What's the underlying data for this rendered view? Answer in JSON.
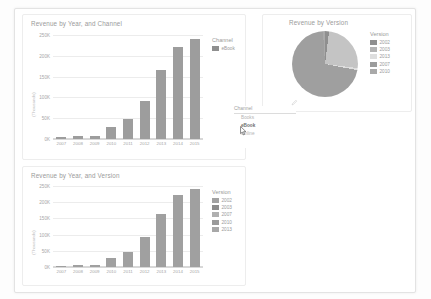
{
  "report": {
    "background_color": "#ffffff",
    "accent_color": "#9d9d9d"
  },
  "charts": {
    "top_left": {
      "title": "Revenue by Year, and Channel",
      "legend_title": "Channel",
      "legend_items": [
        {
          "label": "eBook",
          "color": "#8f8f8f"
        }
      ]
    },
    "bottom_left": {
      "title": "Revenue by Year, and Version",
      "legend_title": "Version",
      "legend_items": [
        {
          "label": "2002",
          "color": "#a2a2a2"
        },
        {
          "label": "2003",
          "color": "#8d8d8d"
        },
        {
          "label": "2007",
          "color": "#b0b0b0"
        },
        {
          "label": "2010",
          "color": "#9a9a9a"
        },
        {
          "label": "2013",
          "color": "#a8a8a8"
        }
      ]
    },
    "pie": {
      "title": "Revenue by Version",
      "legend_title": "Version",
      "legend_items": [
        {
          "label": "2002",
          "color": "#8f8f8f"
        },
        {
          "label": "2003",
          "color": "#b4b4b4"
        },
        {
          "label": "2013",
          "color": "#dedede"
        },
        {
          "label": "2007",
          "color": "#9c9c9c"
        },
        {
          "label": "2010",
          "color": "#a9a9a9"
        }
      ]
    }
  },
  "slicer": {
    "header": "Channel",
    "items": [
      {
        "label": "Books",
        "selected": false
      },
      {
        "label": "eBook",
        "selected": true
      },
      {
        "label": "Online",
        "selected": false
      }
    ]
  },
  "chart_data": [
    {
      "id": "top_left",
      "type": "bar",
      "title": "Revenue by Year, and Channel",
      "xlabel": "",
      "ylabel": "(Thousands)",
      "categories": [
        "2007",
        "2008",
        "2009",
        "2010",
        "2011",
        "2012",
        "2013",
        "2014",
        "2015"
      ],
      "series": [
        {
          "name": "eBook",
          "color": "#9d9d9d",
          "values": [
            5000,
            8000,
            8000,
            30000,
            48000,
            92000,
            165000,
            222000,
            240000
          ]
        }
      ],
      "ylim": [
        0,
        250000
      ],
      "yticks": [
        0,
        50000,
        100000,
        150000,
        200000,
        250000
      ],
      "ytick_labels": [
        "0K",
        "50K",
        "100K",
        "150K",
        "200K",
        "250K"
      ],
      "grid": true,
      "legend_position": "right"
    },
    {
      "id": "bottom_left",
      "type": "bar",
      "title": "Revenue by Year, and Version",
      "xlabel": "",
      "ylabel": "(Thousands)",
      "categories": [
        "2007",
        "2008",
        "2009",
        "2010",
        "2011",
        "2012",
        "2013",
        "2014",
        "2015"
      ],
      "series": [
        {
          "name": "Version total",
          "color": "#a0a0a0",
          "values": [
            4000,
            7000,
            7500,
            29000,
            47000,
            93000,
            165000,
            221000,
            240000
          ]
        }
      ],
      "ylim": [
        0,
        250000
      ],
      "yticks": [
        0,
        50000,
        100000,
        150000,
        200000,
        250000
      ],
      "ytick_labels": [
        "0K",
        "50K",
        "100K",
        "150K",
        "200K",
        "250K"
      ],
      "grid": true,
      "legend_position": "right"
    },
    {
      "id": "pie",
      "type": "pie",
      "title": "Revenue by Version",
      "labels": [
        "2002",
        "2003",
        "2013",
        "2007",
        "2010"
      ],
      "values": [
        2,
        25,
        1,
        71,
        1
      ],
      "colors": [
        "#8f8f8f",
        "#c4c4c4",
        "#dedede",
        "#9f9f9f",
        "#a9a9a9"
      ],
      "legend_position": "right"
    }
  ]
}
